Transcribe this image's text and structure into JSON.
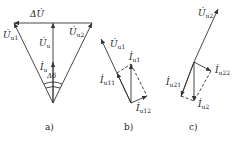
{
  "figure": {
    "panels": [
      {
        "id": "a",
        "caption": "a)",
        "labels": {
          "delta_u": "ΔU̇",
          "u_u1": "U̇",
          "u_u1_sub": "u1",
          "u_u2": "U̇",
          "u_u2_sub": "u2",
          "u_u": "U̇",
          "u_u_sub": "u",
          "i_u": "İ",
          "i_u_sub": "u",
          "delta_delta": "Δδ"
        }
      },
      {
        "id": "b",
        "caption": "b)",
        "labels": {
          "u_u1": "U̇",
          "u_u1_sub": "u1",
          "i_u1": "İ",
          "i_u1_sub": "u1",
          "i_u11": "İ",
          "i_u11_sub": "u11",
          "i_u12": "İ",
          "i_u12_sub": "u12"
        }
      },
      {
        "id": "c",
        "caption": "c)",
        "labels": {
          "u_u2": "U̇",
          "u_u2_sub": "u2",
          "i_u21": "İ",
          "i_u21_sub": "u21",
          "i_u22": "İ",
          "i_u22_sub": "u22",
          "i_u2": "İ",
          "i_u2_sub": "u2"
        }
      }
    ],
    "colors": {
      "line": "#333333",
      "background": "#ffffff"
    }
  }
}
